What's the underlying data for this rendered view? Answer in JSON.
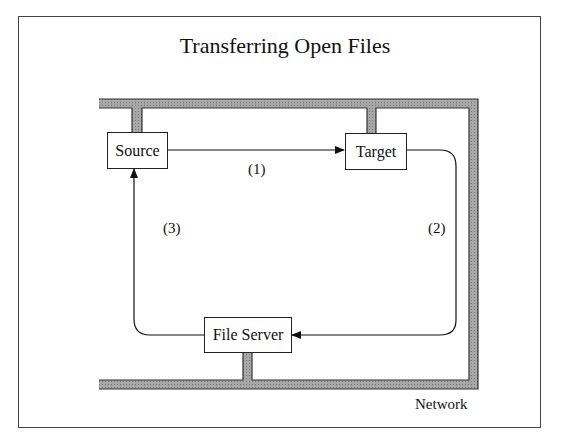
{
  "title": "Transferring Open Files",
  "nodes": {
    "source": {
      "label": "Source"
    },
    "target": {
      "label": "Target"
    },
    "file_server": {
      "label": "File Server"
    }
  },
  "edges": [
    {
      "from": "Source",
      "to": "Target",
      "label": "(1)"
    },
    {
      "from": "Target",
      "to": "File Server",
      "label": "(2)"
    },
    {
      "from": "File Server",
      "to": "Source",
      "label": "(3)"
    }
  ],
  "network": {
    "label": "Network",
    "color": "#9a9a9a"
  }
}
